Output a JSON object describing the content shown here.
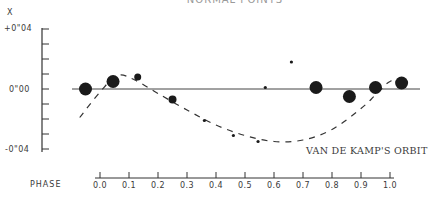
{
  "chart_data": {
    "type": "scatter",
    "title": "NORMAL POINTS",
    "ylabel": "X",
    "xlabel": "PHASE",
    "ylim": [
      -0.04,
      0.04
    ],
    "xlim": [
      0.0,
      1.0
    ],
    "y_ticks": [
      "+0\"04",
      "0\"00",
      "-0\"04"
    ],
    "y_tick_values": [
      0.04,
      0.0,
      -0.04
    ],
    "y_minor_step": 0.01,
    "x_ticks": [
      "0.0",
      "0.1",
      "0.2",
      "0.3",
      "0.4",
      "0.5",
      "0.6",
      "0.7",
      "0.8",
      "0.9",
      "1.0"
    ],
    "grid": false,
    "zero_line": true,
    "series": [
      {
        "name": "Normal points",
        "kind": "scatter",
        "points": [
          {
            "phase": -0.05,
            "x": 0.0,
            "size": "large"
          },
          {
            "phase": 0.045,
            "x": 0.005,
            "size": "large"
          },
          {
            "phase": 0.13,
            "x": 0.008,
            "size": "small"
          },
          {
            "phase": 0.25,
            "x": -0.007,
            "size": "medium"
          },
          {
            "phase": 0.36,
            "x": -0.021,
            "size": "tiny"
          },
          {
            "phase": 0.46,
            "x": -0.031,
            "size": "tiny"
          },
          {
            "phase": 0.545,
            "x": -0.035,
            "size": "tiny"
          },
          {
            "phase": 0.57,
            "x": 0.001,
            "size": "tiny"
          },
          {
            "phase": 0.66,
            "x": 0.018,
            "size": "tiny"
          },
          {
            "phase": 0.745,
            "x": 0.001,
            "size": "large"
          },
          {
            "phase": 0.86,
            "x": -0.005,
            "size": "large"
          },
          {
            "phase": 0.95,
            "x": 0.001,
            "size": "large"
          },
          {
            "phase": 1.04,
            "x": 0.004,
            "size": "large"
          }
        ]
      },
      {
        "name": "VAN DE KAMP'S ORBIT",
        "kind": "line",
        "style": "dashed",
        "phase": [
          -0.07,
          0.0,
          0.06,
          0.12,
          0.2,
          0.3,
          0.4,
          0.5,
          0.6,
          0.7,
          0.8,
          0.9,
          0.95,
          1.0,
          1.06
        ],
        "x": [
          -0.019,
          -0.002,
          0.009,
          0.006,
          -0.003,
          -0.014,
          -0.024,
          -0.031,
          -0.035,
          -0.034,
          -0.027,
          -0.013,
          -0.004,
          0.005,
          0.007
        ]
      }
    ],
    "annotations": [
      "VAN DE KAMP'S ORBIT"
    ]
  },
  "labels": {
    "title": "NORMAL POINTS",
    "y_axis_letter": "X",
    "y_top": "+0\"04",
    "y_mid": "0\"00",
    "y_bottom": "-0\"04",
    "phase": "PHASE",
    "orbit": "VAN DE KAMP'S ORBIT",
    "x_ticks": [
      "0.0",
      "0.1",
      "0.2",
      "0.3",
      "0.4",
      "0.5",
      "0.6",
      "0.7",
      "0.8",
      "0.9",
      "1.0"
    ]
  }
}
